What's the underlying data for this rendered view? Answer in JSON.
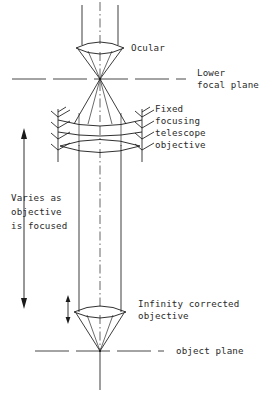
{
  "figure": {
    "type": "optical-ray-diagram",
    "background_color": "#ffffff",
    "line_color": "#1a1a1a"
  },
  "labels": {
    "ocular": "Ocular",
    "lower_focal_plane_line1": "Lower",
    "lower_focal_plane_line2": "focal plane",
    "telescope_objective_line1": "Fixed",
    "telescope_objective_line2": "focusing",
    "telescope_objective_line3": "telescope",
    "telescope_objective_line4": "objective",
    "varies_line1": "Varies as",
    "varies_line2": "objective",
    "varies_line3": "is focused",
    "infinity_objective_line1": "Infinity corrected",
    "infinity_objective_line2": "objective",
    "object_plane": "object plane"
  },
  "geometry": {
    "optical_axis_x": 100,
    "ocular_lens_y": 48,
    "lower_focal_plane_y": 79,
    "telescope_objective_top_lens_y": 124,
    "telescope_objective_bottom_lens_y": 146,
    "infinity_objective_lens_y": 312,
    "object_plane_y": 351,
    "ray_left_x": 79,
    "ray_right_x": 121,
    "varies_arrow_x": 24,
    "varies_arrow_top_y": 131,
    "varies_arrow_bottom_y": 306,
    "focus_arrow_x": 68,
    "focus_arrow_top_y": 296,
    "focus_arrow_bottom_y": 323
  },
  "elements": [
    {
      "name": "ocular-lens",
      "kind": "biconvex-lens"
    },
    {
      "name": "lower-focal-plane",
      "kind": "reference-plane"
    },
    {
      "name": "telescope-objective",
      "kind": "doublet-lens-in-mount"
    },
    {
      "name": "infinity-objective",
      "kind": "biconvex-lens"
    },
    {
      "name": "object-plane",
      "kind": "reference-plane"
    },
    {
      "name": "varies-arrow",
      "kind": "double-headed-arrow"
    },
    {
      "name": "focus-arrow",
      "kind": "double-headed-arrow"
    }
  ]
}
